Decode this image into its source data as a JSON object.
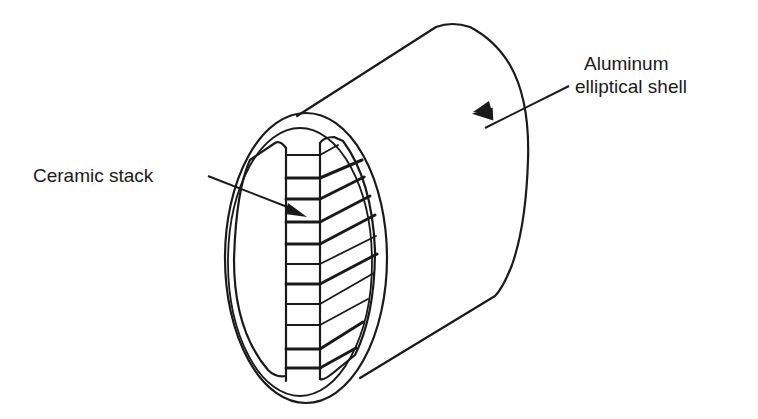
{
  "diagram": {
    "type": "technical-illustration",
    "labels": {
      "shell_line1": "Aluminum",
      "shell_line2": "elliptical shell",
      "stack": "Ceramic stack"
    },
    "colors": {
      "line": "#1a1a1a",
      "background": "#ffffff"
    },
    "stack_plate_count": 12
  }
}
